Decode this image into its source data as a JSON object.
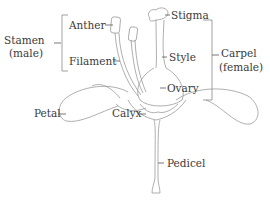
{
  "diagram": {
    "type": "labeled-illustration",
    "groups": {
      "stamen": {
        "label_line1": "Stamen",
        "label_line2": "(male)"
      },
      "carpel": {
        "label_line1": "Carpel",
        "label_line2": "(female)"
      }
    },
    "labels": {
      "anther": "Anther",
      "filament": "Filament",
      "stigma": "Stigma",
      "style": "Style",
      "ovary": "Ovary",
      "petal": "Petal",
      "calyx": "Calyx",
      "pedicel": "Pedicel"
    },
    "colors": {
      "text": "#3a3a3a",
      "outline": "#9a9a9a",
      "leader": "#555555"
    }
  }
}
